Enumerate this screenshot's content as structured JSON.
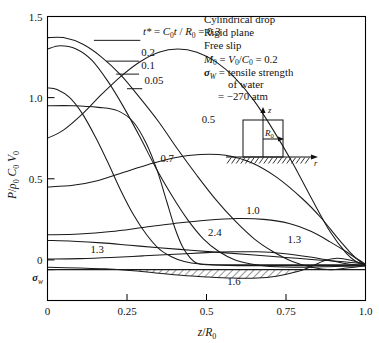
{
  "chart_data": {
    "type": "line",
    "title": "",
    "xlabel": "z/R_0",
    "ylabel": "P/ρ_0 C_0 V_0",
    "xlim": [
      0,
      1.0
    ],
    "ylim": [
      -0.25,
      1.5
    ],
    "grid": false,
    "legend_position": "inline-curve-labels",
    "xticks": [
      "0",
      "0.25",
      "0.5",
      "0.75",
      "1.0"
    ],
    "xtick_values": [
      0,
      0.25,
      0.5,
      0.75,
      1.0
    ],
    "yticks": [
      "0",
      "0.5",
      "1.0",
      "1.5"
    ],
    "ytick_values": [
      0,
      0.5,
      1.0,
      1.5
    ],
    "extra_ytick_label": "σ_w",
    "extra_ytick_value": -0.06,
    "series": [
      {
        "name": "0.05",
        "label": "0.05",
        "points": [
          [
            0,
            0.95
          ],
          [
            0.08,
            0.95
          ],
          [
            0.16,
            0.94
          ],
          [
            0.22,
            0.92
          ],
          [
            0.27,
            0.85
          ],
          [
            0.31,
            0.72
          ],
          [
            0.345,
            0.55
          ],
          [
            0.375,
            0.36
          ],
          [
            0.4,
            0.2
          ],
          [
            0.425,
            0.08
          ],
          [
            0.45,
            0.01
          ],
          [
            0.47,
            -0.02
          ],
          [
            0.5,
            -0.03
          ],
          [
            0.6,
            -0.035
          ],
          [
            0.8,
            -0.035
          ],
          [
            1.0,
            -0.035
          ]
        ]
      },
      {
        "name": "0.1",
        "label": "0.1",
        "points": [
          [
            0,
            1.06
          ],
          [
            0.03,
            1.05
          ],
          [
            0.07,
            1.0
          ],
          [
            0.11,
            0.9
          ],
          [
            0.15,
            0.76
          ],
          [
            0.19,
            0.6
          ],
          [
            0.23,
            0.43
          ],
          [
            0.27,
            0.28
          ],
          [
            0.31,
            0.16
          ],
          [
            0.35,
            0.07
          ],
          [
            0.39,
            0.02
          ],
          [
            0.43,
            -0.01
          ],
          [
            0.48,
            -0.025
          ],
          [
            0.55,
            -0.03
          ],
          [
            0.7,
            -0.03
          ],
          [
            1.0,
            -0.03
          ]
        ]
      },
      {
        "name": "0.2",
        "label": "0.2",
        "points": [
          [
            0,
            1.3
          ],
          [
            0.04,
            1.32
          ],
          [
            0.09,
            1.3
          ],
          [
            0.14,
            1.23
          ],
          [
            0.19,
            1.1
          ],
          [
            0.24,
            0.94
          ],
          [
            0.29,
            0.76
          ],
          [
            0.34,
            0.57
          ],
          [
            0.39,
            0.4
          ],
          [
            0.44,
            0.25
          ],
          [
            0.49,
            0.13
          ],
          [
            0.54,
            0.05
          ],
          [
            0.59,
            0.0
          ],
          [
            0.64,
            -0.025
          ],
          [
            0.7,
            -0.04
          ],
          [
            0.8,
            -0.045
          ],
          [
            0.9,
            -0.04
          ],
          [
            1.0,
            -0.035
          ]
        ]
      },
      {
        "name": "0.3",
        "label": "t* = C_0 t / R_0 = 0.3",
        "points": [
          [
            0,
            1.37
          ],
          [
            0.05,
            1.37
          ],
          [
            0.11,
            1.33
          ],
          [
            0.17,
            1.25
          ],
          [
            0.23,
            1.14
          ],
          [
            0.29,
            1.0
          ],
          [
            0.35,
            0.85
          ],
          [
            0.41,
            0.68
          ],
          [
            0.47,
            0.52
          ],
          [
            0.53,
            0.37
          ],
          [
            0.59,
            0.24
          ],
          [
            0.65,
            0.13
          ],
          [
            0.71,
            0.05
          ],
          [
            0.77,
            -0.01
          ],
          [
            0.83,
            -0.045
          ],
          [
            0.89,
            -0.06
          ],
          [
            0.94,
            -0.05
          ],
          [
            1.0,
            -0.035
          ]
        ]
      },
      {
        "name": "0.5",
        "label": "0.5",
        "points": [
          [
            0,
            0.75
          ],
          [
            0.05,
            0.8
          ],
          [
            0.11,
            0.9
          ],
          [
            0.17,
            1.02
          ],
          [
            0.23,
            1.13
          ],
          [
            0.29,
            1.22
          ],
          [
            0.35,
            1.28
          ],
          [
            0.41,
            1.3
          ],
          [
            0.47,
            1.28
          ],
          [
            0.53,
            1.22
          ],
          [
            0.59,
            1.12
          ],
          [
            0.65,
            0.98
          ],
          [
            0.71,
            0.8
          ],
          [
            0.77,
            0.6
          ],
          [
            0.83,
            0.38
          ],
          [
            0.89,
            0.17
          ],
          [
            0.94,
            0.04
          ],
          [
            0.97,
            -0.01
          ],
          [
            1.0,
            -0.03
          ]
        ]
      },
      {
        "name": "0.7",
        "label": "0.7",
        "points": [
          [
            0,
            0.45
          ],
          [
            0.08,
            0.46
          ],
          [
            0.16,
            0.49
          ],
          [
            0.24,
            0.54
          ],
          [
            0.32,
            0.59
          ],
          [
            0.4,
            0.63
          ],
          [
            0.48,
            0.65
          ],
          [
            0.56,
            0.645
          ],
          [
            0.64,
            0.6
          ],
          [
            0.72,
            0.51
          ],
          [
            0.8,
            0.38
          ],
          [
            0.86,
            0.26
          ],
          [
            0.91,
            0.14
          ],
          [
            0.95,
            0.05
          ],
          [
            0.98,
            -0.005
          ],
          [
            1.0,
            -0.03
          ]
        ]
      },
      {
        "name": "1.0",
        "label": "1.0",
        "points": [
          [
            0,
            0.155
          ],
          [
            0.1,
            0.16
          ],
          [
            0.2,
            0.175
          ],
          [
            0.3,
            0.2
          ],
          [
            0.4,
            0.225
          ],
          [
            0.5,
            0.245
          ],
          [
            0.6,
            0.255
          ],
          [
            0.68,
            0.25
          ],
          [
            0.76,
            0.225
          ],
          [
            0.83,
            0.175
          ],
          [
            0.89,
            0.11
          ],
          [
            0.94,
            0.05
          ],
          [
            0.97,
            0.01
          ],
          [
            1.0,
            -0.025
          ]
        ]
      },
      {
        "name": "2.4",
        "label": "2.4",
        "points": [
          [
            0,
            0.12
          ],
          [
            0.08,
            0.115
          ],
          [
            0.17,
            0.105
          ],
          [
            0.26,
            0.09
          ],
          [
            0.35,
            0.075
          ],
          [
            0.45,
            0.06
          ],
          [
            0.55,
            0.045
          ],
          [
            0.65,
            0.03
          ],
          [
            0.75,
            0.015
          ],
          [
            0.85,
            0.0
          ],
          [
            0.92,
            -0.01
          ],
          [
            1.0,
            -0.025
          ]
        ]
      },
      {
        "name": "1.3",
        "label": "1.3",
        "points": [
          [
            0,
            0.005
          ],
          [
            0.1,
            0.008
          ],
          [
            0.2,
            0.015
          ],
          [
            0.3,
            0.025
          ],
          [
            0.4,
            0.035
          ],
          [
            0.5,
            0.045
          ],
          [
            0.58,
            0.05
          ],
          [
            0.66,
            0.05
          ],
          [
            0.74,
            0.04
          ],
          [
            0.82,
            0.02
          ],
          [
            0.88,
            0.0
          ],
          [
            0.93,
            -0.02
          ],
          [
            0.97,
            -0.03
          ],
          [
            1.0,
            -0.03
          ]
        ]
      },
      {
        "name": "1.6",
        "label": "1.6",
        "points": [
          [
            0,
            -0.045
          ],
          [
            0.1,
            -0.05
          ],
          [
            0.18,
            -0.055
          ],
          [
            0.26,
            -0.065
          ],
          [
            0.34,
            -0.08
          ],
          [
            0.42,
            -0.095
          ],
          [
            0.5,
            -0.105
          ],
          [
            0.58,
            -0.112
          ],
          [
            0.66,
            -0.112
          ],
          [
            0.72,
            -0.1
          ],
          [
            0.78,
            -0.075
          ],
          [
            0.83,
            -0.04
          ],
          [
            0.87,
            -0.005
          ],
          [
            0.91,
            0.01
          ],
          [
            0.95,
            0.0
          ],
          [
            1.0,
            -0.03
          ]
        ]
      },
      {
        "name": "sigma_w_line",
        "label": "σ_w",
        "points": [
          [
            0,
            -0.06
          ],
          [
            0.25,
            -0.06
          ],
          [
            0.5,
            -0.06
          ],
          [
            0.75,
            -0.06
          ],
          [
            1.0,
            -0.06
          ]
        ]
      }
    ],
    "shaded_region": {
      "label": "tension region below σ_w",
      "hatch": "diagonal",
      "x_start": 0.2,
      "x_end": 0.83
    },
    "curve_labels": [
      {
        "text": "t* = C_0t / R_0 = 0.3",
        "x": 0.3,
        "y": 1.385
      },
      {
        "text": "0.2",
        "x": 0.295,
        "y": 1.255
      },
      {
        "text": "0.1",
        "x": 0.295,
        "y": 1.175
      },
      {
        "text": "0.05",
        "x": 0.305,
        "y": 1.085
      },
      {
        "text": "0.5",
        "x": 0.485,
        "y": 0.845
      },
      {
        "text": "0.7",
        "x": 0.355,
        "y": 0.605
      },
      {
        "text": "1.0",
        "x": 0.625,
        "y": 0.285
      },
      {
        "text": "2.4",
        "x": 0.505,
        "y": 0.145
      },
      {
        "text": "1.3",
        "x": 0.755,
        "y": 0.105
      },
      {
        "text": "1.3",
        "x": 0.135,
        "y": 0.045
      },
      {
        "text": "1.6",
        "x": 0.565,
        "y": -0.155
      }
    ]
  },
  "annotation_box": {
    "lines": [
      "Cylindrical drop",
      "Rigid plane",
      "Free slip",
      "M_0 = V_0 / C_0 = 0.2",
      "σ_W = tensile strength",
      "of water",
      "= −270 atm"
    ],
    "line1": "Cylindrical drop",
    "line2": "Rigid plane",
    "line3": "Free slip",
    "line4_m0": "M",
    "line4_m0_sub": "0",
    "line4_eq": " = ",
    "line4_v0": "V",
    "line4_v0_sub": "0",
    "line4_slash": "/",
    "line4_c0": "C",
    "line4_c0_sub": "0",
    "line4_val": " = 0.2",
    "line5_sigma": "σ",
    "line5_sigma_sub": "W",
    "line5_rest": " = tensile strength",
    "line6": "of water",
    "line7": "= −270 atm"
  },
  "inset": {
    "name": "cylindrical-drop-schematic",
    "z_axis_label": "z",
    "r_axis_label": "r",
    "radius_label": "R",
    "radius_sub": "0",
    "ground": "hatched rigid plane"
  },
  "axis": {
    "ylabel_P": "P",
    "ylabel_slash": "/",
    "ylabel_rho": "ρ",
    "ylabel_rho_sub": "0",
    "ylabel_C": "C",
    "ylabel_C_sub": "0",
    "ylabel_V": "V",
    "ylabel_V_sub": "0",
    "xlabel_z": "z",
    "xlabel_slash": "/",
    "xlabel_R": "R",
    "xlabel_R_sub": "0",
    "sigma_tick": "σ",
    "sigma_tick_sub": "w"
  },
  "colors": {
    "curve": "#1a1a1a",
    "frame": "#000000",
    "background": "#ffffff",
    "text": "#111111"
  }
}
